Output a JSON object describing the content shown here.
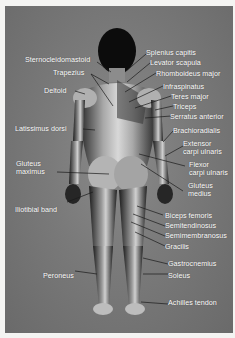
{
  "figure": {
    "background_color": "#7a7a7a",
    "label_color": "#ffffff"
  },
  "labels": {
    "sternocleidomastoid": "Sternocleidomastoid",
    "trapezius": "Trapezius",
    "deltoid": "Deltoid",
    "latissimus_dorsi": "Latissimus dorsi",
    "gluteus_maximus_1": "Gluteus",
    "gluteus_maximus_2": "maximus",
    "iliotibial_band": "Iliotibial band",
    "peroneus": "Peroneus",
    "splenius_capitis": "Splenius capitis",
    "levator_scapula": "Levator scapula",
    "rhomboideus_major": "Rhomboideus major",
    "infraspinatus": "Infraspinatus",
    "teres_major": "Teres major",
    "triceps": "Triceps",
    "serratus_anterior": "Serratus anterior",
    "brachioradialis": "Brachioradialis",
    "extensor_carpi_ulnaris_1": "Extensor",
    "extensor_carpi_ulnaris_2": "carpi ulnaris",
    "flexor_carpi_ulnaris_1": "Flexor",
    "flexor_carpi_ulnaris_2": "carpi ulnaris",
    "gluteus_medius_1": "Gluteus",
    "gluteus_medius_2": "medius",
    "biceps_femoris": "Biceps femoris",
    "semitendinosus": "Semitendinosus",
    "semimembranosus": "Semimembranosus",
    "gracilis": "Gracilis",
    "gastrocnemius": "Gastrocnemius",
    "soleus": "Soleus",
    "achilles_tendon": "Achilles tendon"
  }
}
